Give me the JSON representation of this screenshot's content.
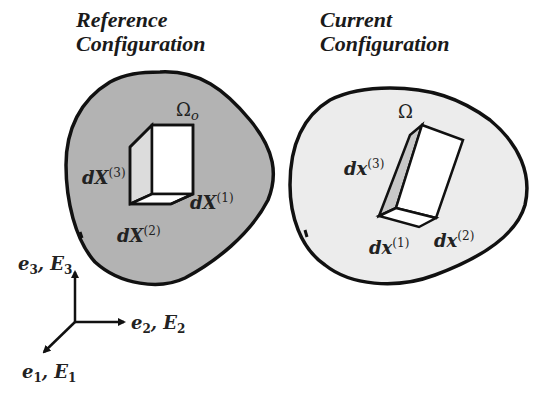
{
  "reference": {
    "title_line1": "Reference",
    "title_line2": "Configuration",
    "domain_symbol": "Ω",
    "domain_subscript": "o",
    "fill_color": "#b3b3b3",
    "vectors": [
      {
        "base": "dX",
        "index": "(1)"
      },
      {
        "base": "dX",
        "index": "(2)"
      },
      {
        "base": "dX",
        "index": "(3)"
      }
    ]
  },
  "current": {
    "title_line1": "Current",
    "title_line2": "Configuration",
    "domain_symbol": "Ω",
    "fill_color": "#ececec",
    "vectors": [
      {
        "base": "dx",
        "index": "(1)"
      },
      {
        "base": "dx",
        "index": "(2)"
      },
      {
        "base": "dx",
        "index": "(3)"
      }
    ]
  },
  "axes": {
    "axis1": {
      "e": "e",
      "e_sub": "1",
      "sep": ", ",
      "E": "E",
      "E_sub": "1"
    },
    "axis2": {
      "e": "e",
      "e_sub": "2",
      "sep": ", ",
      "E": "E",
      "E_sub": "2"
    },
    "axis3": {
      "e": "e",
      "e_sub": "3",
      "sep": ", ",
      "E": "E",
      "E_sub": "3"
    }
  },
  "colors": {
    "outline": "#111111",
    "cube_face": "#ffffff",
    "side_face_reference": "#dcdcdc",
    "side_face_current": "#c8c8c8"
  }
}
